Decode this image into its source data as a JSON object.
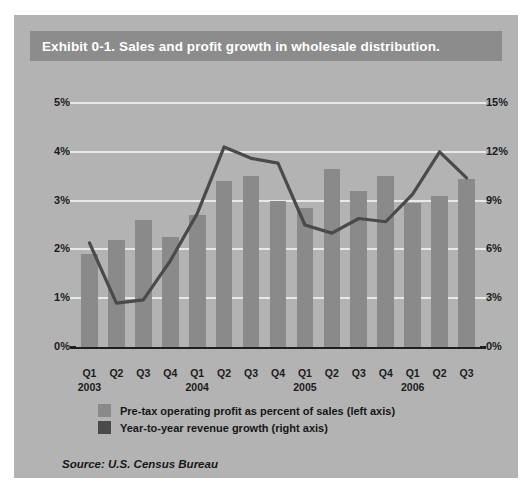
{
  "figure": {
    "title": "Exhibit 0-1. Sales and profit growth in wholesale distribution.",
    "source": "Source: U.S. Census Bureau",
    "colors": {
      "background": "#b3b3b3",
      "title_bar": "#8c8c8c",
      "title_text": "#ffffff",
      "bar": "#8a8a8a",
      "line": "#4a4a4a",
      "gridline": "#e9e9e9",
      "axis": "#1f1f1f"
    }
  },
  "legend": {
    "position": "below-plot",
    "items": [
      {
        "label": "Pre-tax operating profit as percent of sales (left axis)",
        "color": "#8a8a8a",
        "type": "bar"
      },
      {
        "label": "Year-to-year revenue growth (right axis)",
        "color": "#4a4a4a",
        "type": "line"
      }
    ]
  },
  "chart_data": {
    "type": "bar",
    "title": "Exhibit 0-1. Sales and profit growth in wholesale distribution.",
    "xlabel": "",
    "ylabel": "",
    "grid": true,
    "categories": [
      "Q1",
      "Q2",
      "Q3",
      "Q4",
      "Q1",
      "Q2",
      "Q3",
      "Q4",
      "Q1",
      "Q2",
      "Q3",
      "Q4",
      "Q1",
      "Q2",
      "Q3"
    ],
    "year_groups": [
      {
        "year": "2003",
        "start_index": 0,
        "span": 4
      },
      {
        "year": "2004",
        "start_index": 4,
        "span": 4
      },
      {
        "year": "2005",
        "start_index": 8,
        "span": 4
      },
      {
        "year": "2006",
        "start_index": 12,
        "span": 3
      }
    ],
    "x_tick_labels": [
      "Q1 2003",
      "Q2",
      "Q3",
      "Q4",
      "Q1 2004",
      "Q2",
      "Q3",
      "Q4",
      "Q1 2005",
      "Q2",
      "Q3",
      "Q4",
      "Q1 2006",
      "Q2",
      "Q3"
    ],
    "left_axis": {
      "label": "Pre-tax operating profit as percent of sales",
      "ylim": [
        0,
        5
      ],
      "ticks": [
        0,
        1,
        2,
        3,
        4,
        5
      ],
      "tick_labels": [
        "0%",
        "1%",
        "2%",
        "3%",
        "4%",
        "5%"
      ],
      "unit": "%"
    },
    "right_axis": {
      "label": "Year-to-year revenue growth",
      "ylim": [
        0,
        15
      ],
      "ticks": [
        0,
        3,
        6,
        9,
        12,
        15
      ],
      "tick_labels": [
        "0%",
        "3%",
        "6%",
        "9%",
        "12%",
        "15%"
      ],
      "unit": "%"
    },
    "series": [
      {
        "name": "Pre-tax operating profit as percent of sales (left axis)",
        "type": "bar",
        "axis": "left",
        "color": "#8a8a8a",
        "values": [
          1.9,
          2.2,
          2.6,
          2.25,
          2.7,
          3.4,
          3.5,
          3.0,
          2.85,
          3.65,
          3.2,
          3.5,
          2.95,
          3.1,
          3.45
        ]
      },
      {
        "name": "Year-to-year revenue growth (right axis)",
        "type": "line",
        "axis": "right",
        "color": "#4a4a4a",
        "values": [
          6.4,
          2.7,
          2.9,
          5.3,
          8.2,
          12.3,
          11.6,
          11.3,
          7.5,
          7.0,
          7.9,
          7.7,
          9.4,
          12.0,
          10.4
        ]
      }
    ]
  }
}
